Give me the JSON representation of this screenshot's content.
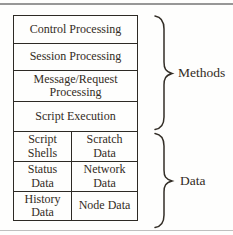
{
  "diagram": {
    "method_rows": [
      "Control Processing",
      "Session Processing",
      "Message/Request Processing",
      "Script Execution"
    ],
    "data_grid": [
      [
        "Script Shells",
        "Scratch Data"
      ],
      [
        "Status Data",
        "Network Data"
      ],
      [
        "History Data",
        "Node Data"
      ]
    ],
    "brace_labels": {
      "methods": "Methods",
      "data": "Data"
    }
  },
  "colors": {
    "background": "#fefefd",
    "text": "#332c24",
    "box_border": "#2d2a25",
    "brace_stroke": "#332e27",
    "rule_top": "#979797",
    "rule_bottom": "#bfbfbf"
  }
}
